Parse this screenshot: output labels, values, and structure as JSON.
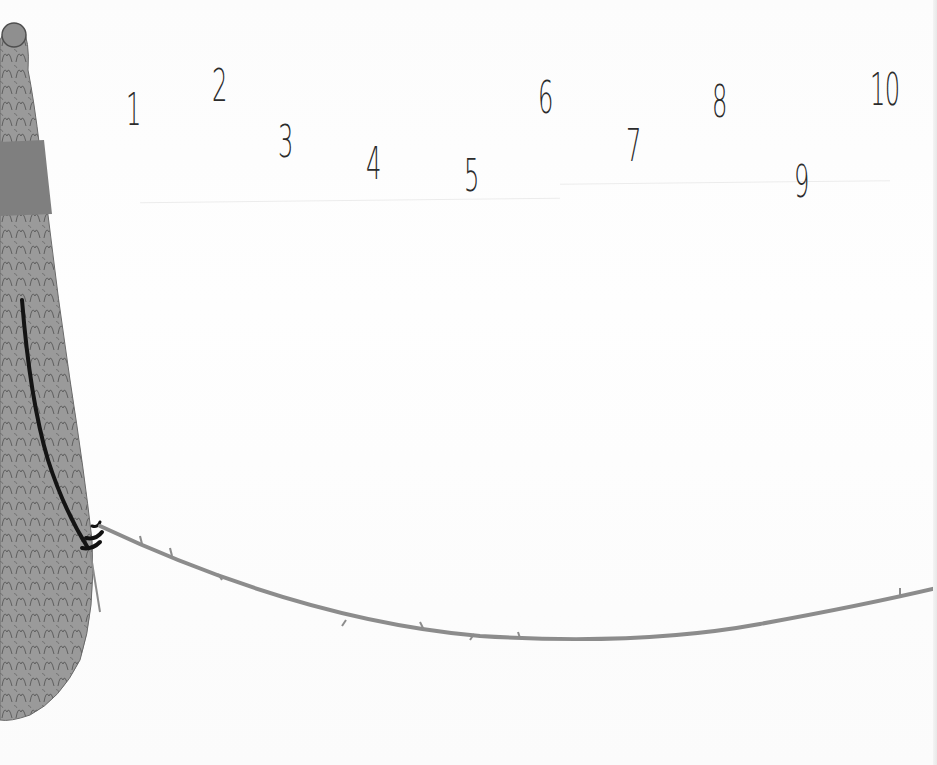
{
  "illustration": {
    "description": "Picture-book page: a shaggy grey creature at left holds a long thorny branch stretching across the page; numbers 1 through 10 are scattered across the top.",
    "colors": {
      "background": "#fdfdfd",
      "numerals": "#2b2b2b",
      "fur": "#8a8a8a",
      "fur_band": "#7d7d7d",
      "branch": "#8c8c8c",
      "claws": "#111111"
    },
    "numbers": [
      {
        "label": "1",
        "x": 126,
        "y": 88
      },
      {
        "label": "2",
        "x": 212,
        "y": 64
      },
      {
        "label": "3",
        "x": 278,
        "y": 120
      },
      {
        "label": "4",
        "x": 366,
        "y": 142
      },
      {
        "label": "5",
        "x": 464,
        "y": 154
      },
      {
        "label": "6",
        "x": 538,
        "y": 76
      },
      {
        "label": "7",
        "x": 626,
        "y": 124
      },
      {
        "label": "8",
        "x": 712,
        "y": 80
      },
      {
        "label": "9",
        "x": 794,
        "y": 160
      },
      {
        "label": "10",
        "x": 870,
        "y": 68
      }
    ]
  }
}
